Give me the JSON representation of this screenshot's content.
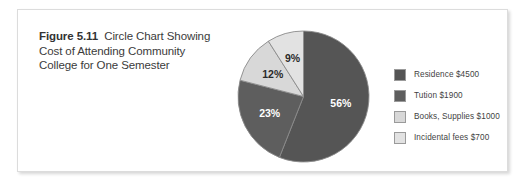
{
  "figure": {
    "number_label": "Figure 5.11",
    "caption_text": "Circle Chart Showing Cost of Attending Community College for One Semester"
  },
  "chart_data": {
    "type": "pie",
    "categories": [
      "Residence",
      "Tution",
      "Books, Supplies",
      "Incidental fees"
    ],
    "values": [
      4500,
      1900,
      1000,
      700
    ],
    "percent_labels": [
      "56%",
      "12%",
      "9%",
      "23%"
    ],
    "slices": [
      {
        "label": "Residence $4500",
        "category": "Residence",
        "amount": "$4500",
        "value": 4500,
        "percent": 56,
        "percent_label": "56%",
        "color": "#555555",
        "label_text_color": "#ffffff"
      },
      {
        "label": "Tution $1900",
        "category": "Tution",
        "amount": "$1900",
        "value": 1900,
        "percent": 23,
        "percent_label": "23%",
        "color": "#5e5e5e",
        "label_text_color": "#ffffff"
      },
      {
        "label": "Books, Supplies $1000",
        "category": "Books, Supplies",
        "amount": "$1000",
        "value": 1000,
        "percent": 12,
        "percent_label": "12%",
        "color": "#d8d8d8",
        "label_text_color": "#2b2b2b"
      },
      {
        "label": "Incidental fees $700",
        "category": "Incidental fees",
        "amount": "$700",
        "value": 700,
        "percent": 9,
        "percent_label": "9%",
        "color": "#e2e2e2",
        "label_text_color": "#2b2b2b"
      }
    ],
    "start_angle_deg": 0,
    "direction": "clockwise",
    "legend_position": "right",
    "grid": false
  },
  "legend": {
    "items": [
      {
        "label": "Residence $4500",
        "color": "#555555"
      },
      {
        "label": "Tution $1900",
        "color": "#5e5e5e"
      },
      {
        "label": "Books, Supplies $1000",
        "color": "#d8d8d8"
      },
      {
        "label": "Incidental fees $700",
        "color": "#e2e2e2"
      }
    ]
  },
  "colors": {
    "page_background": "#ffffff",
    "box_border": "#dcdcdc",
    "caption_text": "#3b3b3b",
    "slice_outline": "#8a8a8a"
  }
}
